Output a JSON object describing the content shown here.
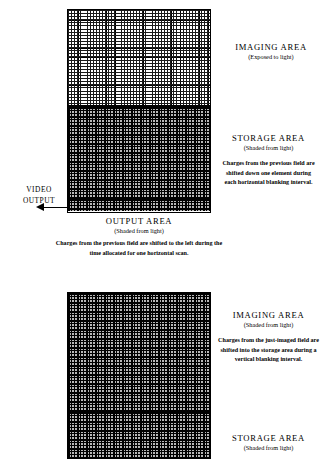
{
  "diagram": {
    "type": "frame-transfer-ccd",
    "top_array": {
      "imaging": {
        "title": "IMAGING  AREA",
        "subtitle": "(Exposed to light)",
        "shaded": false
      },
      "storage": {
        "title": "STORAGE  AREA",
        "subtitle": "(Shaded from light)",
        "body": "Charges from the previous field are shifted down one element during each horizontal blanking interval.",
        "shaded": true
      },
      "output": {
        "title": "OUTPUT  AREA",
        "subtitle": "(Shaded from light)",
        "body": "Charges from the previous field are shifted to the left during the time allocated for one horizontal scan.",
        "shaded": true
      },
      "video_output_label": "VIDEO\nOUTPUT"
    },
    "bottom_array": {
      "imaging": {
        "title": "IMAGING  AREA",
        "subtitle": "(Shaded from light)",
        "body": "Charges from the just-imaged field are shifted into the storage area during a vertical blanking interval.",
        "shaded": true
      },
      "storage": {
        "title": "STORAGE  AREA",
        "subtitle": "(Shaded from light)",
        "shaded": true
      }
    },
    "colors": {
      "ink": "#000000",
      "paper": "#ffffff",
      "shaded_fill": "#b7b7b7"
    }
  }
}
